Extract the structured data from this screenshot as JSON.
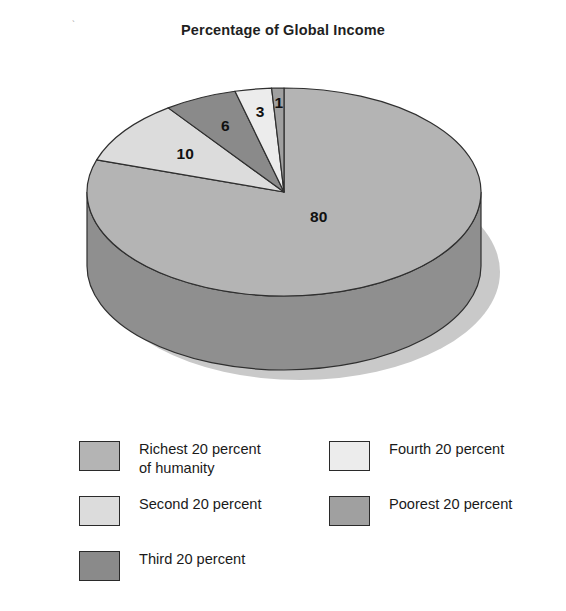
{
  "chart_data": {
    "type": "pie",
    "title": "Percentage of Global Income",
    "xlabel": "",
    "ylabel": "",
    "legend_position": "bottom",
    "grid": false,
    "three_d": true,
    "categories": [
      "Richest 20 percent of humanity",
      "Second 20 percent",
      "Third 20 percent",
      "Fourth 20 percent",
      "Poorest 20 percent"
    ],
    "values": [
      80,
      10,
      6,
      3,
      1
    ],
    "data_labels": [
      "80",
      "10",
      "6",
      "3",
      "1"
    ],
    "colors": [
      "#b4b4b4",
      "#dcdcdc",
      "#8a8a8a",
      "#ececec",
      "#a0a0a0"
    ]
  },
  "title": "Percentage of Global Income",
  "pie": {
    "slices": [
      {
        "key": "richest",
        "label": "80",
        "value": 80,
        "color": "#b4b4b4",
        "side_color": "#8f8f8f",
        "name": "slice-richest-20-percent"
      },
      {
        "key": "second",
        "label": "10",
        "value": 10,
        "color": "#dcdcdc",
        "side_color": "#b3b3b3",
        "name": "slice-second-20-percent"
      },
      {
        "key": "third",
        "label": "6",
        "value": 6,
        "color": "#8a8a8a",
        "side_color": "#6e6e6e",
        "name": "slice-third-20-percent"
      },
      {
        "key": "fourth",
        "label": "3",
        "value": 3,
        "color": "#ececec",
        "side_color": "#bfbfbf",
        "name": "slice-fourth-20-percent"
      },
      {
        "key": "poorest",
        "label": "1",
        "value": 1,
        "color": "#a0a0a0",
        "side_color": "#808080",
        "name": "slice-poorest-20-percent"
      }
    ]
  },
  "legend": {
    "left_column": [
      {
        "label": "Richest 20 percent\nof humanity",
        "color": "#b4b4b4",
        "name": "legend-item-richest"
      },
      {
        "label": "Second 20 percent",
        "color": "#dcdcdc",
        "name": "legend-item-second"
      },
      {
        "label": "Third 20 percent",
        "color": "#8a8a8a",
        "name": "legend-item-third"
      }
    ],
    "right_column": [
      {
        "label": "Fourth 20 percent",
        "color": "#ececec",
        "name": "legend-item-fourth"
      },
      {
        "label": "Poorest 20 percent",
        "color": "#a0a0a0",
        "name": "legend-item-poorest"
      }
    ]
  }
}
